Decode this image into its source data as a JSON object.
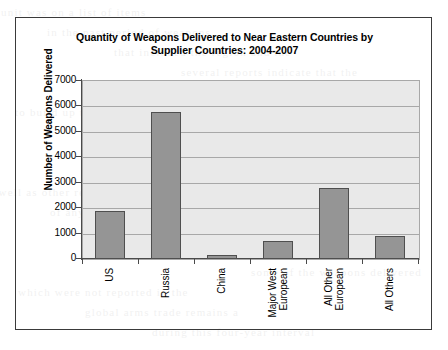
{
  "chart_data": {
    "type": "bar",
    "title": "Quantity of Weapons Delivered to Near Eastern Countries by Supplier Countries: 2004-2007",
    "title_line1": "Quantity of Weapons Delivered to Near Eastern Countries by",
    "title_line2": "Supplier Countries: 2004-2007",
    "xlabel": "",
    "ylabel": "Number of Weapons Delivered",
    "categories": [
      "US",
      "Russia",
      "China",
      "Major West European",
      "All Other European",
      "All Others"
    ],
    "category_lines": [
      [
        "US"
      ],
      [
        "Russia"
      ],
      [
        "China"
      ],
      [
        "Major West",
        "European"
      ],
      [
        "All Other",
        "European"
      ],
      [
        "All Others"
      ]
    ],
    "values": [
      1900,
      5800,
      160,
      700,
      2800,
      900
    ],
    "ylim": [
      0,
      7000
    ],
    "yticks": [
      0,
      1000,
      2000,
      3000,
      4000,
      5000,
      6000,
      7000
    ],
    "ytick_labels": [
      "0",
      "1000",
      "2000",
      "3000",
      "4000",
      "5000",
      "6000",
      "7000"
    ],
    "grid": true,
    "legend": null,
    "colors": {
      "bar_fill": "#959595",
      "bar_stroke": "#4f4f4f",
      "plot_background": "#e9e9e9",
      "gridline": "#a8a8a8",
      "axis": "#4a4a4a",
      "frame": "#3a3a3a",
      "text": "#000000"
    }
  },
  "bleed_text": [
    "the  unit  was  on  a  list  of  items",
    "in  the  past  period  of  weapons",
    "that  included  the  region  and  the",
    "several  reports  indicate  that  the",
    "an  increase  in  the  numbers  of",
    "to  build  up  their  armed  forces",
    "of  the  supplier  states  have  also",
    "countries  in  the  region  received",
    "for  the  period  listed  in  the  table",
    "as  well  as  other  related  systems",
    "of  any  country  in  the  region",
    "that  the  data  are  based  upon",
    "by  the  governments  involved",
    "some  of  the  weapons  delivered",
    "which  were  not  reported  in  the",
    "global  arms  trade  remains  a",
    "during  this  four-year  interval"
  ]
}
